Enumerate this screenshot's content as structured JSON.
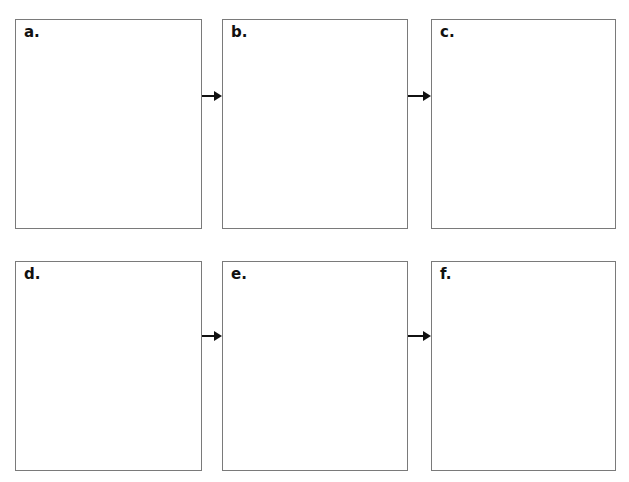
{
  "diagram": {
    "border_color": "#7a7a7a",
    "arrow_color": "#111111",
    "panels": [
      {
        "id": "a",
        "label": "a.",
        "x": 15,
        "y": 19,
        "w": 187,
        "h": 210
      },
      {
        "id": "b",
        "label": "b.",
        "x": 222,
        "y": 19,
        "w": 186,
        "h": 210
      },
      {
        "id": "c",
        "label": "c.",
        "x": 431,
        "y": 19,
        "w": 185,
        "h": 210
      },
      {
        "id": "d",
        "label": "d.",
        "x": 15,
        "y": 261,
        "w": 187,
        "h": 210
      },
      {
        "id": "e",
        "label": "e.",
        "x": 222,
        "y": 261,
        "w": 186,
        "h": 210
      },
      {
        "id": "f",
        "label": "f.",
        "x": 431,
        "y": 261,
        "w": 185,
        "h": 210
      }
    ],
    "arrows": [
      {
        "from": "a",
        "to": "b"
      },
      {
        "from": "b",
        "to": "c"
      },
      {
        "from": "d",
        "to": "e"
      },
      {
        "from": "e",
        "to": "f"
      }
    ]
  }
}
